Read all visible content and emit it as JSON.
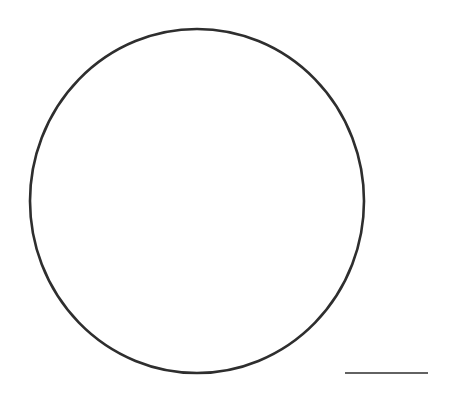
{
  "figure": {
    "background": "#ffffff",
    "shapes": {
      "circle": {
        "cx": 197,
        "cy": 201,
        "rx": 167,
        "ry": 172,
        "stroke": "#2e2e2e",
        "stroke_width": 2.6
      },
      "scale_bar": {
        "x1": 345,
        "y1": 373,
        "x2": 428,
        "y2": 373,
        "stroke": "#2e2e2e",
        "stroke_width": 1.6
      }
    }
  }
}
